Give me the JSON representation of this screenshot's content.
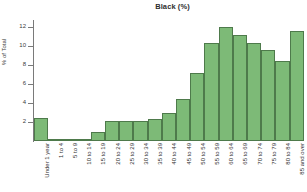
{
  "chart_data": {
    "type": "bar",
    "title": "Black (%)",
    "xlabel": "",
    "ylabel": "% of Total",
    "ylim": [
      0,
      12.6
    ],
    "yticks": [
      12,
      10,
      8,
      6,
      4,
      2
    ],
    "grid": false,
    "legend": null,
    "categories": [
      "Under 1 year",
      "1 to 4",
      "5 to 9",
      "10 to 14",
      "15 to 19",
      "20 to 24",
      "25 to 29",
      "30 to 34",
      "35 to 39",
      "40 to 44",
      "45 to 49",
      "50 to 54",
      "55 to 59",
      "60 to 64",
      "65 to 69",
      "70 to 74",
      "75 to 79",
      "80 to 84",
      "85 and over"
    ],
    "values": [
      2.45,
      0.2,
      0.05,
      0.15,
      0.95,
      2.15,
      2.1,
      2.1,
      2.3,
      2.9,
      4.4,
      7.1,
      10.3,
      12.0,
      11.15,
      10.25,
      9.55,
      8.45,
      11.6
    ],
    "colors": {
      "bar_fill": "#7dba77",
      "bar_border": "#4e7a4b",
      "axis": "#7a7a7a",
      "text": "#2e2e2e",
      "background": "#ffffff"
    }
  }
}
